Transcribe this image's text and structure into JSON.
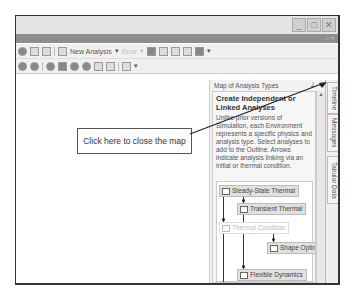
{
  "window": {
    "controls": {
      "minimize": "_",
      "maximize": "□",
      "close": "✕"
    }
  },
  "toolbar_row1": {
    "new_analysis_label": "New Analysis",
    "disabled_dropdown_label": "Error"
  },
  "map_panel": {
    "title": "Map of Analysis Types",
    "pin_icon": "⊥",
    "close_icon": "×",
    "heading": "Create Independent or Linked Analyses",
    "description": "Unlike prior versions of Simulation, each Environment represents a specific physics and analysis type. Select analyses to add to the Outline. Arrows indicate analysis linking via an initial or thermal condition.",
    "nodes": [
      {
        "label": "Steady-State Thermal",
        "faded": false
      },
      {
        "label": "Transient Thermal",
        "faded": false
      },
      {
        "label": "Thermal Condition",
        "faded": true
      },
      {
        "label": "Shape Optimization",
        "faded": false
      },
      {
        "label": "Flexible Dynamics",
        "faded": false
      },
      {
        "label": "Static Structural",
        "faded": false
      },
      {
        "label": "Fatigue",
        "faded": true
      }
    ]
  },
  "side_tabs": [
    "Timeline",
    "Messages",
    "Tabular Data"
  ],
  "callout": {
    "text": "Click here to close the map"
  }
}
